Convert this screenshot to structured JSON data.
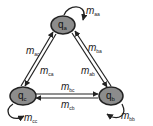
{
  "diagram": {
    "type": "state-transition",
    "colors": {
      "node_fill": "#8c8c8c",
      "node_stroke": "#222222",
      "edge": "#222222",
      "text": "#222222"
    },
    "nodes": [
      {
        "id": "a",
        "symbol": "q",
        "subscript": "a"
      },
      {
        "id": "b",
        "symbol": "q",
        "subscript": "b"
      },
      {
        "id": "c",
        "symbol": "q",
        "subscript": "c"
      }
    ],
    "edges": [
      {
        "from": "a",
        "to": "a",
        "symbol": "m",
        "subscript": "aa"
      },
      {
        "from": "b",
        "to": "b",
        "symbol": "m",
        "subscript": "bb"
      },
      {
        "from": "c",
        "to": "c",
        "symbol": "m",
        "subscript": "cc"
      },
      {
        "from": "a",
        "to": "c",
        "symbol": "m",
        "subscript": "ac"
      },
      {
        "from": "c",
        "to": "a",
        "symbol": "m",
        "subscript": "ca"
      },
      {
        "from": "b",
        "to": "a",
        "symbol": "m",
        "subscript": "ba"
      },
      {
        "from": "a",
        "to": "b",
        "symbol": "m",
        "subscript": "ab"
      },
      {
        "from": "b",
        "to": "c",
        "symbol": "m",
        "subscript": "bc"
      },
      {
        "from": "c",
        "to": "b",
        "symbol": "m",
        "subscript": "cb"
      }
    ]
  }
}
